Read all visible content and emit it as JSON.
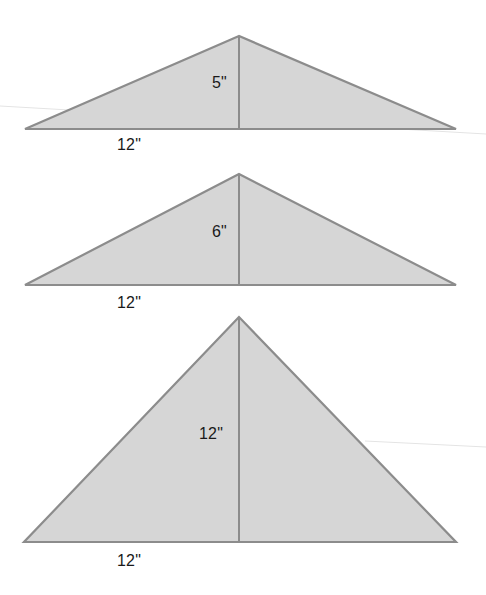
{
  "figure": {
    "triangles": [
      {
        "id": "triangle-1",
        "base_label": "12\"",
        "height_label": "5\"",
        "base_in": 12,
        "height_in": 5,
        "geometry": {
          "apex": [
            239,
            36
          ],
          "left": [
            25,
            129
          ],
          "right": [
            456,
            129
          ]
        },
        "height_label_pos": [
          212,
          75
        ],
        "base_label_pos": [
          117,
          137
        ]
      },
      {
        "id": "triangle-2",
        "base_label": "12\"",
        "height_label": "6\"",
        "base_in": 12,
        "height_in": 6,
        "geometry": {
          "apex": [
            239,
            174
          ],
          "left": [
            25,
            285
          ],
          "right": [
            456,
            285
          ]
        },
        "height_label_pos": [
          212,
          224
        ],
        "base_label_pos": [
          117,
          295
        ]
      },
      {
        "id": "triangle-3",
        "base_label": "12\"",
        "height_label": "12\"",
        "base_in": 12,
        "height_in": 12,
        "geometry": {
          "apex": [
            239,
            317
          ],
          "left": [
            24,
            542
          ],
          "right": [
            456,
            542
          ]
        },
        "height_label_pos": [
          199,
          426
        ],
        "base_label_pos": [
          117,
          553
        ]
      }
    ],
    "colors": {
      "fill": "#d6d6d6",
      "stroke": "#8c8c8c",
      "text": "#1a1a1a",
      "background": "#ffffff"
    }
  }
}
